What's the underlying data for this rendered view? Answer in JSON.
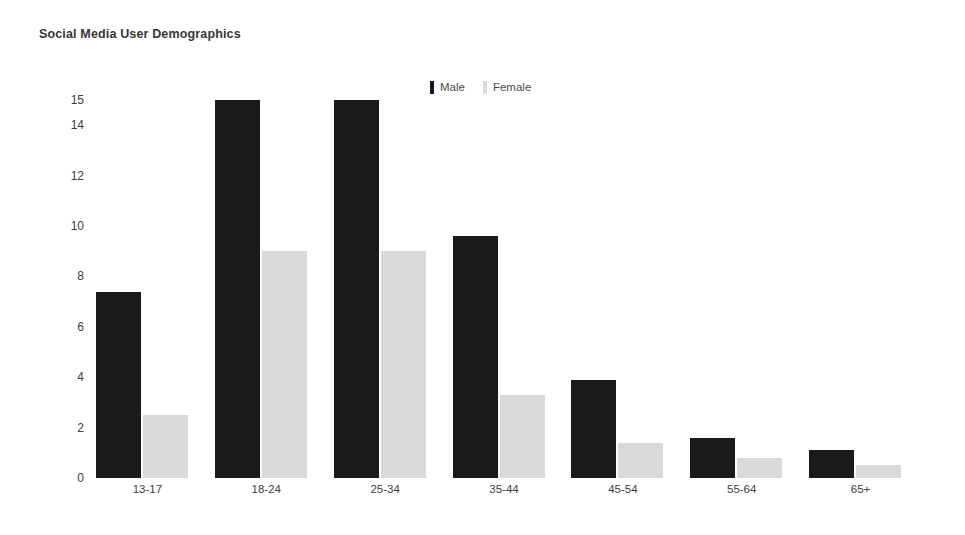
{
  "chart_data": {
    "type": "bar",
    "title": "Social Media User Demographics",
    "xlabel": "",
    "ylabel": "",
    "categories": [
      "13-17",
      "18-24",
      "25-34",
      "35-44",
      "45-54",
      "55-64",
      "65+"
    ],
    "series": [
      {
        "name": "Male",
        "color": "#1a1a1a",
        "values": [
          7.4,
          15,
          15,
          9.6,
          3.9,
          1.6,
          1.1
        ]
      },
      {
        "name": "Female",
        "color": "#d9d9d9",
        "values": [
          2.5,
          9,
          9,
          3.3,
          1.4,
          0.8,
          0.5
        ]
      }
    ],
    "ylim": [
      0,
      15
    ],
    "yticks": [
      0,
      2,
      4,
      6,
      8,
      10,
      12,
      14,
      15
    ],
    "ytick_labels": [
      "0",
      "2",
      "4",
      "6",
      "8",
      "10",
      "12",
      "14",
      "15"
    ],
    "grid": false,
    "legend_position": "top-center",
    "legend_entries": [
      {
        "label": "Male",
        "swatch": "#1a1a1a"
      },
      {
        "label": "Female",
        "swatch": "#d9d9d9"
      }
    ]
  },
  "colors": {
    "male": "#1a1a1a",
    "female": "#d9d9d9",
    "text": "#3b3b3b",
    "background": "#ffffff"
  }
}
